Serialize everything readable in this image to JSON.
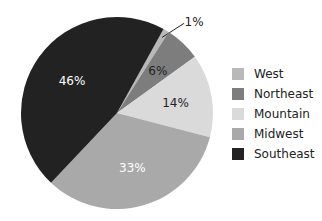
{
  "chart_data": {
    "type": "pie",
    "title": "",
    "start_angle_deg": 29,
    "slices": [
      {
        "label": "West",
        "value": 1,
        "display": "1%",
        "color": "#b8b8b8",
        "label_color": "#222222"
      },
      {
        "label": "Northeast",
        "value": 6,
        "display": "6%",
        "color": "#7d7d7d",
        "label_color": "#222222"
      },
      {
        "label": "Mountain",
        "value": 14,
        "display": "14%",
        "color": "#dadada",
        "label_color": "#222222"
      },
      {
        "label": "Midwest",
        "value": 33,
        "display": "33%",
        "color": "#a9a9a9",
        "label_color": "#ffffff"
      },
      {
        "label": "Southeast",
        "value": 46,
        "display": "46%",
        "color": "#222222",
        "label_color": "#ffffff"
      }
    ],
    "legend": {
      "position": "right",
      "entries": [
        "West",
        "Northeast",
        "Mountain",
        "Midwest",
        "Southeast"
      ]
    }
  },
  "legend": {
    "items": [
      {
        "label": "West",
        "color": "#b8b8b8"
      },
      {
        "label": "Northeast",
        "color": "#7d7d7d"
      },
      {
        "label": "Mountain",
        "color": "#dadada"
      },
      {
        "label": "Midwest",
        "color": "#a9a9a9"
      },
      {
        "label": "Southeast",
        "color": "#222222"
      }
    ]
  }
}
